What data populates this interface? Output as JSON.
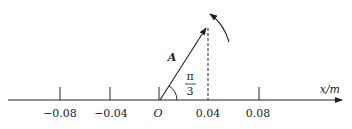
{
  "diagram": {
    "axis": {
      "label": "x/m",
      "ticks": [
        {
          "label": "−0.08",
          "x": 60
        },
        {
          "label": "−0.04",
          "x": 110
        },
        {
          "label": "O",
          "x": 160
        },
        {
          "label": "0.04",
          "x": 208
        },
        {
          "label": "0.08",
          "x": 259
        }
      ]
    },
    "vector": {
      "label": "A",
      "angle_numerator": "π",
      "angle_denominator": "3"
    },
    "rotation": "counterclockwise"
  }
}
